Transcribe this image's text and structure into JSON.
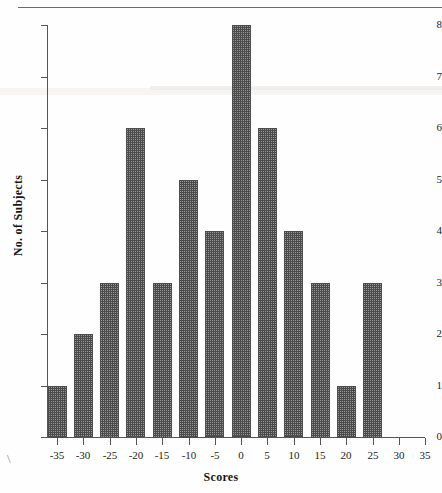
{
  "figure": {
    "top_rule": true,
    "scan_artifact": "\\"
  },
  "chart_data": {
    "type": "bar",
    "title": "",
    "xlabel": "Scores",
    "ylabel": "No. of Subjects",
    "categories": [
      "-35",
      "-30",
      "-25",
      "-20",
      "-15",
      "-10",
      "-5",
      "0",
      "5",
      "10",
      "15",
      "20",
      "25",
      "30",
      "35"
    ],
    "values": [
      1,
      2,
      3,
      6,
      3,
      5,
      4,
      8,
      6,
      4,
      3,
      1,
      3,
      0,
      0
    ],
    "x_tick_labels": [
      "-35",
      "-30",
      "-25",
      "-20",
      "-15",
      "-10",
      "-5",
      "0",
      "5",
      "10",
      "15",
      "20",
      "25",
      "30",
      "35"
    ],
    "y_tick_labels": [
      "0",
      "1",
      "2",
      "3",
      "4",
      "5",
      "6",
      "7",
      "8"
    ],
    "y_ticks": [
      0,
      1,
      2,
      3,
      4,
      5,
      6,
      7,
      8
    ],
    "xlim": [
      -37.5,
      37.5
    ],
    "ylim": [
      0,
      8
    ],
    "grid": false,
    "legend": null,
    "bar_fill": "#9a9a9a",
    "bar_edge": "#4c4c4c",
    "axis_color": "#555555"
  }
}
